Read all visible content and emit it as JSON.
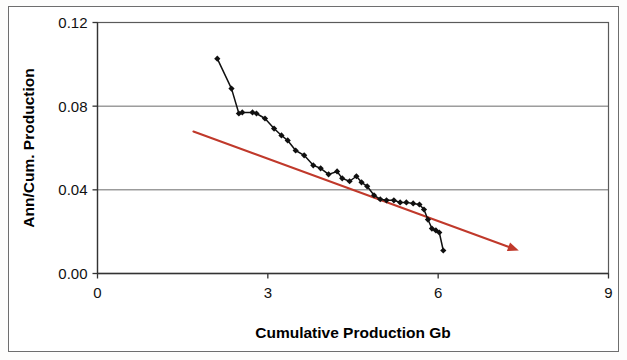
{
  "chart_data": {
    "type": "line",
    "title": "",
    "subtitle": "",
    "xlabel": "Cumulative Production Gb",
    "ylabel": "Ann/Cum. Production",
    "xlim": [
      0,
      9
    ],
    "ylim": [
      0,
      0.12
    ],
    "xticks": [
      0,
      3,
      6,
      9
    ],
    "xtick_labels": [
      "0",
      "3",
      "6",
      "9"
    ],
    "yticks": [
      0.0,
      0.04,
      0.08,
      0.12
    ],
    "ytick_labels": [
      "0.00",
      "0.04",
      "0.08",
      "0.12"
    ],
    "grid": "horizontal",
    "legend": "none",
    "series": [
      {
        "name": "Ann/Cum Production",
        "color": "#101010",
        "marker": "diamond",
        "line_style": "solid",
        "points": [
          [
            2.11,
            0.1027
          ],
          [
            2.36,
            0.0884
          ],
          [
            2.49,
            0.0765
          ],
          [
            2.55,
            0.077
          ],
          [
            2.73,
            0.077
          ],
          [
            2.8,
            0.0765
          ],
          [
            2.95,
            0.0741
          ],
          [
            3.11,
            0.0693
          ],
          [
            3.24,
            0.066
          ],
          [
            3.35,
            0.0636
          ],
          [
            3.49,
            0.0588
          ],
          [
            3.64,
            0.0565
          ],
          [
            3.8,
            0.0517
          ],
          [
            3.93,
            0.0503
          ],
          [
            4.07,
            0.0474
          ],
          [
            4.22,
            0.0488
          ],
          [
            4.31,
            0.0455
          ],
          [
            4.44,
            0.0441
          ],
          [
            4.56,
            0.0465
          ],
          [
            4.65,
            0.0436
          ],
          [
            4.75,
            0.0417
          ],
          [
            4.87,
            0.0374
          ],
          [
            4.98,
            0.0355
          ],
          [
            5.09,
            0.035
          ],
          [
            5.22,
            0.035
          ],
          [
            5.33,
            0.034
          ],
          [
            5.44,
            0.034
          ],
          [
            5.56,
            0.0335
          ],
          [
            5.67,
            0.033
          ],
          [
            5.75,
            0.0306
          ],
          [
            5.82,
            0.0258
          ],
          [
            5.89,
            0.0215
          ],
          [
            5.96,
            0.0206
          ],
          [
            6.02,
            0.0196
          ],
          [
            6.09,
            0.011
          ]
        ]
      }
    ],
    "trendline": {
      "name": "linear-trend-arrow",
      "color": "#C0392B",
      "arrow": true,
      "start": [
        1.69,
        0.0679
      ],
      "end": [
        7.42,
        0.011
      ]
    }
  }
}
